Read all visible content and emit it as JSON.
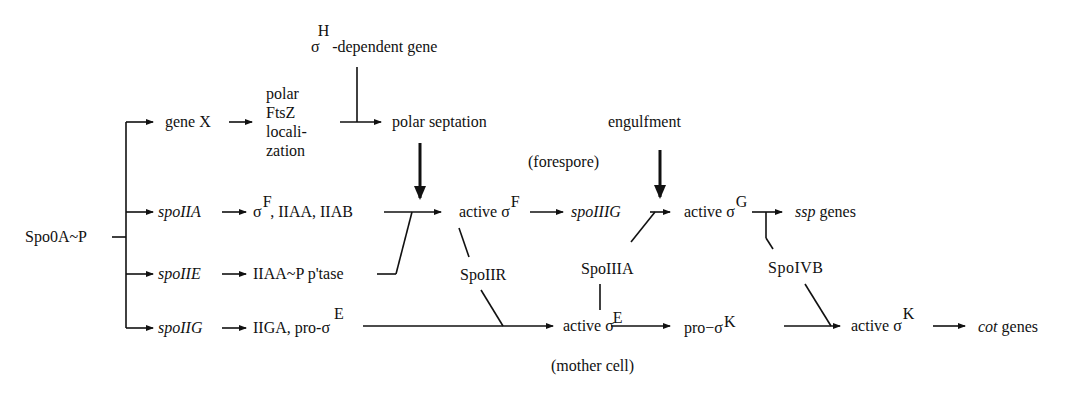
{
  "diagram": {
    "type": "regulatory-pathway",
    "nodes": {
      "spo0a": {
        "label": "Spo0A~P"
      },
      "gene_x": {
        "label": "gene X"
      },
      "ftsz": {
        "lines": [
          "polar",
          "FtsZ",
          "locali-",
          "zation"
        ]
      },
      "sigma_h_gene": {
        "sigma": "σ",
        "sup": "H",
        "label": "-dependent gene"
      },
      "polar_septation": {
        "label": "polar septation"
      },
      "engulfment": {
        "label": "engulfment"
      },
      "forespore": {
        "label": "(forespore)"
      },
      "spoiia": {
        "label": "spoIIA"
      },
      "sigma_f_iiaa_iiab": {
        "sigma": "σ",
        "sup": "F",
        "label": ",  IIAA, IIAB"
      },
      "active_sigma_f": {
        "label": "active ",
        "sigma": "σ",
        "sup": "F"
      },
      "spoiiig": {
        "label": "spoIIIG"
      },
      "active_sigma_g": {
        "label": "active ",
        "sigma": "σ",
        "sup": "G"
      },
      "ssp_genes": {
        "italic": "ssp",
        "label": " genes"
      },
      "spoiie": {
        "label": "spoIIE"
      },
      "iiaa_ptase": {
        "label": "IIAA~P p'tase"
      },
      "spoiir": {
        "label": "SpoIIR"
      },
      "spoiiia": {
        "label": "SpoIIIA"
      },
      "spoivb": {
        "label": "SpoIVB"
      },
      "spoiig": {
        "label": "spoIIG"
      },
      "iiga_pro_sigma_e": {
        "label": "IIGA, pro-",
        "sigma": "σ",
        "sup": "E"
      },
      "active_sigma_e": {
        "label": "active ",
        "sigma": "σ",
        "sup": "E"
      },
      "pro_sigma_k": {
        "label": "pro−",
        "sigma": "σ",
        "sup": "K"
      },
      "active_sigma_k": {
        "label": "active ",
        "sigma": "σ",
        "sup": "K"
      },
      "cot_genes": {
        "italic": "cot",
        "label": " genes"
      },
      "mother_cell": {
        "label": "(mother cell)"
      }
    },
    "edges": [
      {
        "from": "Spo0A~P",
        "to": "gene X",
        "type": "activates"
      },
      {
        "from": "Spo0A~P",
        "to": "spoIIA",
        "type": "activates"
      },
      {
        "from": "Spo0A~P",
        "to": "spoIIE",
        "type": "activates"
      },
      {
        "from": "Spo0A~P",
        "to": "spoIIG",
        "type": "activates"
      },
      {
        "from": "gene X",
        "to": "polar FtsZ localization",
        "type": "activates"
      },
      {
        "from": "polar FtsZ localization",
        "to": "polar septation",
        "type": "activates"
      },
      {
        "from": "σH-dependent gene",
        "to": "polar septation",
        "type": "joins"
      },
      {
        "from": "spoIIA",
        "to": "σF, IIAA, IIAB",
        "type": "activates"
      },
      {
        "from": "σF, IIAA, IIAB",
        "to": "active σF",
        "type": "activates"
      },
      {
        "from": "IIAA~P p'tase",
        "to": "active σF",
        "type": "joins"
      },
      {
        "from": "polar septation",
        "to": "active σF",
        "type": "required"
      },
      {
        "from": "spoIIE",
        "to": "IIAA~P p'tase",
        "type": "activates"
      },
      {
        "from": "active σF",
        "to": "spoIIIG",
        "type": "activates"
      },
      {
        "from": "active σF",
        "to": "SpoIIR",
        "type": "link"
      },
      {
        "from": "spoIIIG",
        "to": "active σG",
        "type": "activates"
      },
      {
        "from": "engulfment",
        "to": "active σG",
        "type": "required"
      },
      {
        "from": "SpoIIIA",
        "to": "active σG",
        "type": "joins"
      },
      {
        "from": "active σE",
        "to": "SpoIIIA",
        "type": "link"
      },
      {
        "from": "active σG",
        "to": "ssp genes",
        "type": "activates"
      },
      {
        "from": "active σG",
        "to": "SpoIVB",
        "type": "link"
      },
      {
        "from": "spoIIG",
        "to": "IIGA, pro-σE",
        "type": "activates"
      },
      {
        "from": "IIGA, pro-σE",
        "to": "active σE",
        "type": "activates"
      },
      {
        "from": "SpoIIR",
        "to": "active σE",
        "type": "joins"
      },
      {
        "from": "active σE",
        "to": "pro-σK",
        "type": "activates"
      },
      {
        "from": "pro-σK",
        "to": "active σK",
        "type": "activates"
      },
      {
        "from": "SpoIVB",
        "to": "active σK",
        "type": "joins"
      },
      {
        "from": "active σK",
        "to": "cot genes",
        "type": "activates"
      }
    ]
  }
}
